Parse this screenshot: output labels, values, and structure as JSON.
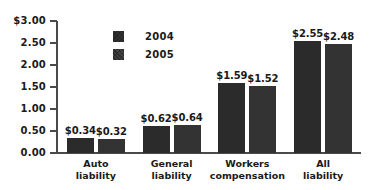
{
  "chart_data": {
    "type": "bar",
    "title": "",
    "subtitle": "",
    "xlabel": "",
    "ylabel": "",
    "ylim": [
      0,
      3.0
    ],
    "ytick_labels": [
      "$3.00",
      "2.50",
      "2.00",
      "1.50",
      "1.00",
      "0.50",
      "0.00"
    ],
    "ytick_values": [
      3.0,
      2.5,
      2.0,
      1.5,
      1.0,
      0.5,
      0.0
    ],
    "grid": false,
    "legend_position": "inside-upper-left",
    "categories": [
      "Auto liability",
      "General liability",
      "Workers compensation",
      "All liability"
    ],
    "category_lines": [
      [
        "Auto",
        "liability"
      ],
      [
        "General",
        "liability"
      ],
      [
        "Workers",
        "compensation"
      ],
      [
        "All",
        "liability"
      ]
    ],
    "series": [
      {
        "name": "2004",
        "values": [
          0.34,
          0.62,
          1.59,
          2.55
        ],
        "value_labels": [
          "$0.34",
          "$0.62",
          "$1.59",
          "$2.55"
        ],
        "color": "#2b2b2b"
      },
      {
        "name": "2005",
        "values": [
          0.32,
          0.64,
          1.52,
          2.48
        ],
        "value_labels": [
          "$0.32",
          "$0.64",
          "$1.52",
          "$2.48"
        ],
        "color": "#333333"
      }
    ]
  },
  "legend": {
    "items": [
      {
        "label": "2004"
      },
      {
        "label": "2005"
      }
    ]
  },
  "colors": {
    "bar_2004": "#2b2b2b",
    "bar_2005": "#333333",
    "axis": "#4a4a4a",
    "text": "#1a1a1a",
    "background": "#ffffff"
  }
}
